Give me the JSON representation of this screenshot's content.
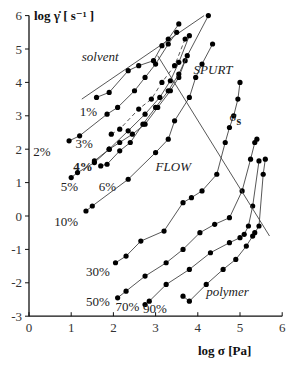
{
  "chart_data": {
    "type": "line",
    "title": "",
    "xlabel": "log σ [Pa]",
    "ylabel": "log γ̇ [ s⁻¹ ]",
    "xlim": [
      0,
      6
    ],
    "ylim": [
      -3,
      6
    ],
    "xticks": [
      0,
      1,
      2,
      3,
      4,
      5,
      6
    ],
    "yticks": [
      -3,
      -2,
      -1,
      0,
      1,
      2,
      3,
      4,
      5,
      6
    ],
    "grid": false,
    "legend": "none (curves labeled inline by concentration)",
    "region_labels": [
      {
        "text": "solvent",
        "x": 1.25,
        "y": 4.65,
        "style": "italic"
      },
      {
        "text": "SPURT",
        "x": 3.9,
        "y": 4.25,
        "style": "italic"
      },
      {
        "text": "FLOW",
        "x": 3.0,
        "y": 1.35,
        "style": "italic"
      },
      {
        "text": "polymer",
        "x": 4.2,
        "y": -2.4,
        "style": "italic"
      },
      {
        "text": "σs",
        "x": 4.75,
        "y": 2.85,
        "style": "normal"
      }
    ],
    "series": [
      {
        "name": "solvent",
        "label": "",
        "style": "solid",
        "markers": false,
        "x": [
          1.25,
          4.15
        ],
        "y": [
          3.5,
          6.0
        ]
      },
      {
        "name": "1%",
        "label": "1%",
        "label_pos": [
          1.2,
          3.0
        ],
        "style": "solid",
        "markers": true,
        "x": [
          1.6,
          1.9,
          2.35,
          2.6,
          2.95,
          3.15,
          3.3,
          3.55
        ],
        "y": [
          3.55,
          3.7,
          4.35,
          4.5,
          4.65,
          5.1,
          5.3,
          5.75
        ]
      },
      {
        "name": "2%",
        "label": "2%",
        "label_pos": [
          0.1,
          1.8
        ],
        "style": "solid",
        "markers": true,
        "x": [
          0.95,
          1.2,
          1.85,
          2.1,
          2.5,
          2.75,
          3.0,
          3.3,
          3.5
        ],
        "y": [
          2.25,
          2.4,
          3.05,
          3.25,
          3.75,
          4.15,
          4.55,
          5.15,
          5.5
        ]
      },
      {
        "name": "3%",
        "label": "3%",
        "label_pos": [
          1.1,
          2.05
        ],
        "style": "dashed",
        "markers": true,
        "x": [
          1.95,
          2.15,
          2.6,
          2.9,
          3.15,
          3.45,
          3.7
        ],
        "y": [
          2.45,
          2.6,
          3.2,
          3.5,
          4.0,
          4.5,
          5.3
        ]
      },
      {
        "name": "4%",
        "label": "4%",
        "label_pos": [
          1.05,
          1.35
        ],
        "style": "solid",
        "markers": true,
        "x": [
          1.55,
          1.9,
          2.35,
          2.75,
          3.1,
          3.35,
          3.55,
          3.8
        ],
        "y": [
          1.65,
          2.0,
          2.55,
          3.05,
          3.55,
          4.05,
          4.6,
          5.4
        ]
      },
      {
        "name": "5%",
        "label": "5%",
        "label_pos": [
          0.75,
          0.75
        ],
        "style": "solid",
        "markers": true,
        "x": [
          1.0,
          1.15,
          1.55,
          1.9,
          2.15,
          2.45,
          2.75,
          3.05,
          3.35,
          3.55,
          3.7
        ],
        "y": [
          1.15,
          1.3,
          1.6,
          2.0,
          2.2,
          2.45,
          2.75,
          3.25,
          3.75,
          4.15,
          4.65
        ]
      },
      {
        "name": "6%",
        "label": "6%",
        "label_pos": [
          1.65,
          0.75
        ],
        "style": "solid",
        "markers": true,
        "x": [
          1.7,
          1.85,
          2.15,
          2.4,
          2.7,
          3.0,
          3.3,
          3.55,
          3.75,
          4.25
        ],
        "y": [
          1.5,
          1.55,
          1.95,
          2.2,
          2.75,
          3.25,
          3.75,
          4.25,
          4.8,
          6.0
        ]
      },
      {
        "name": "10%",
        "label": "10%",
        "label_pos": [
          0.6,
          -0.3
        ],
        "style": "solid",
        "markers": true,
        "x": [
          1.35,
          1.5,
          2.35,
          3.0,
          3.3,
          3.45,
          3.8,
          3.95,
          4.1,
          4.35
        ],
        "y": [
          0.15,
          0.3,
          1.1,
          1.9,
          2.3,
          2.85,
          3.55,
          4.15,
          4.55,
          5.15
        ]
      },
      {
        "name": "30%",
        "label": "30%",
        "label_pos": [
          1.35,
          -1.8
        ],
        "style": "solid",
        "markers": true,
        "x": [
          2.05,
          2.3,
          2.65,
          3.2,
          3.65,
          3.85,
          4.1,
          4.45,
          4.65,
          4.75,
          4.85,
          4.95,
          5.0
        ],
        "y": [
          -1.4,
          -1.2,
          -0.75,
          -0.45,
          0.4,
          0.55,
          0.75,
          1.25,
          2.2,
          2.65,
          3.0,
          3.5,
          4.0
        ]
      },
      {
        "name": "50%",
        "label": "50%",
        "label_pos": [
          1.35,
          -2.7
        ],
        "style": "solid",
        "markers": true,
        "x": [
          2.1,
          2.3,
          2.75,
          3.25,
          3.65,
          4.05,
          4.4,
          4.75,
          5.05,
          5.25,
          5.35,
          5.4
        ],
        "y": [
          -2.45,
          -2.25,
          -1.8,
          -1.4,
          -1.0,
          -0.5,
          -0.25,
          -0.05,
          0.75,
          1.7,
          2.2,
          2.3
        ]
      },
      {
        "name": "70%",
        "label": "70%",
        "label_pos": [
          2.05,
          -2.85
        ],
        "style": "solid",
        "markers": true,
        "x": [
          2.75,
          2.85,
          3.25,
          3.8,
          4.3,
          4.75,
          5.0,
          5.1,
          5.2,
          5.3,
          5.45
        ],
        "y": [
          -2.65,
          -2.55,
          -2.05,
          -1.6,
          -1.1,
          -0.8,
          -0.65,
          -0.55,
          -0.3,
          0.3,
          1.65
        ]
      },
      {
        "name": "90%",
        "label": "90%",
        "label_pos": [
          2.7,
          -2.9
        ],
        "style": "solid",
        "markers": true,
        "x": [
          3.65,
          3.8,
          4.2,
          4.6,
          4.9,
          5.15,
          5.3,
          5.35,
          5.45,
          5.55,
          5.6
        ],
        "y": [
          -2.4,
          -2.55,
          -2.05,
          -1.6,
          -1.3,
          -0.9,
          -0.6,
          -0.5,
          -0.3,
          1.25,
          1.7
        ]
      },
      {
        "name": "σs boundary",
        "label": "",
        "style": "solid",
        "markers": false,
        "x": [
          3.05,
          5.7
        ],
        "y": [
          4.8,
          -0.6
        ]
      }
    ]
  }
}
